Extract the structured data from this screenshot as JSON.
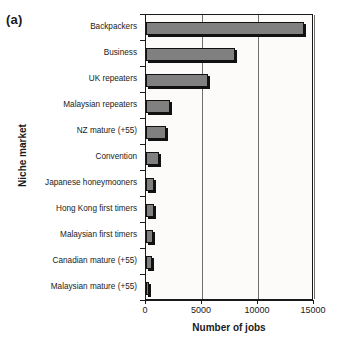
{
  "panel": {
    "label": "(a)"
  },
  "chart_data": {
    "type": "bar",
    "orientation": "horizontal",
    "title": "",
    "xlabel": "Number of jobs",
    "ylabel": "Niche market",
    "xlim": [
      0,
      15000
    ],
    "xticks": [
      0,
      5000,
      10000,
      15000
    ],
    "xticklabels": [
      "0",
      "5000",
      "10000",
      "15000"
    ],
    "grid": "vertical",
    "legend": "none",
    "bar_color": "#808080",
    "bar_edge_color": "#111111",
    "categories": [
      "Backpackers",
      "Business",
      "UK repeaters",
      "Malaysian repeaters",
      "NZ mature (+55)",
      "Convention",
      "Japanese honeymooners",
      "Hong Kong first timers",
      "Malaysian first timers",
      "Canadian mature (+55)",
      "Malaysian mature (+55)"
    ],
    "values": [
      14150,
      7950,
      5550,
      2100,
      1750,
      1200,
      750,
      700,
      650,
      500,
      300
    ]
  }
}
